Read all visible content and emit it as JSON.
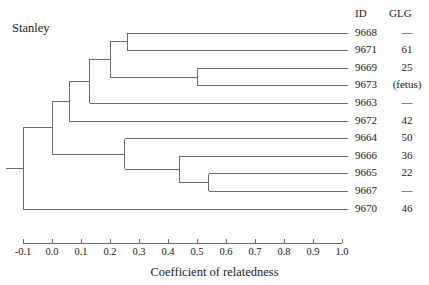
{
  "title": "Stanley",
  "columns": {
    "id_header": "ID",
    "glg_header": "GLG"
  },
  "axis": {
    "label": "Coefficient of relatedness",
    "ticks": [
      "-0.1",
      "0.0",
      "0.1",
      "0.2",
      "0.3",
      "0.4",
      "0.5",
      "0.6",
      "0.7",
      "0.8",
      "0.9",
      "1.0"
    ],
    "min": -0.1,
    "max": 1.0,
    "step": 0.1
  },
  "chart_data": {
    "type": "dendrogram",
    "title": "Stanley",
    "xlabel": "Coefficient of relatedness",
    "ylabel": "",
    "xlim": [
      -0.1,
      1.0
    ],
    "xticks": [
      -0.1,
      0.0,
      0.1,
      0.2,
      0.3,
      0.4,
      0.5,
      0.6,
      0.7,
      0.8,
      0.9,
      1.0
    ],
    "grid": false,
    "legend": false,
    "leaves": [
      {
        "id": "9668",
        "glg": "—",
        "row": 0
      },
      {
        "id": "9671",
        "glg": "61",
        "row": 1
      },
      {
        "id": "9669",
        "glg": "25",
        "row": 2
      },
      {
        "id": "9673",
        "glg": "(fetus)",
        "row": 3
      },
      {
        "id": "9663",
        "glg": "—",
        "row": 4
      },
      {
        "id": "9672",
        "glg": "42",
        "row": 5
      },
      {
        "id": "9664",
        "glg": "50",
        "row": 6
      },
      {
        "id": "9666",
        "glg": "36",
        "row": 7
      },
      {
        "id": "9665",
        "glg": "22",
        "row": 8
      },
      {
        "id": "9667",
        "glg": "—",
        "row": 9
      },
      {
        "id": "9670",
        "glg": "46",
        "row": 10
      }
    ],
    "merges": [
      {
        "name": "n-9668-9671",
        "height": 0.26,
        "children": [
          "9668",
          "9671"
        ]
      },
      {
        "name": "n-9669-9673",
        "height": 0.5,
        "children": [
          "9669",
          "9673"
        ]
      },
      {
        "name": "n-upper-a",
        "height": 0.2,
        "children": [
          "n-9668-9671",
          "n-9669-9673"
        ]
      },
      {
        "name": "n-upper-b",
        "height": 0.13,
        "children": [
          "n-upper-a",
          "9663"
        ]
      },
      {
        "name": "n-upper-c",
        "height": 0.06,
        "children": [
          "n-upper-b",
          "9672"
        ]
      },
      {
        "name": "n-9665-9667",
        "height": 0.54,
        "children": [
          "9665",
          "9667"
        ]
      },
      {
        "name": "n-lower-a",
        "height": 0.44,
        "children": [
          "9666",
          "n-9665-9667"
        ]
      },
      {
        "name": "n-lower-b",
        "height": 0.25,
        "children": [
          "9664",
          "n-lower-a"
        ]
      },
      {
        "name": "n-main",
        "height": 0.0,
        "children": [
          "n-upper-c",
          "n-lower-b"
        ]
      },
      {
        "name": "n-root",
        "height": -0.1,
        "children": [
          "n-main",
          "9670"
        ]
      }
    ]
  }
}
